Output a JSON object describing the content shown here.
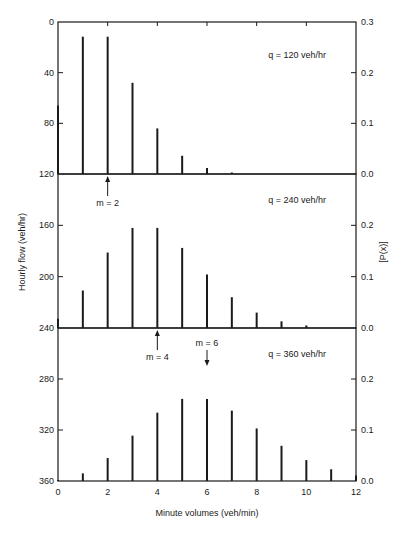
{
  "chart_data": {
    "type": "bar",
    "title": "",
    "xlabel": "Minute volumes (veh/min)",
    "ylabel_left": "Hourly flow (veh/hr)",
    "ylabel_right": "[P(x)]",
    "x_ticks": [
      0,
      2,
      4,
      6,
      8,
      10,
      12
    ],
    "xlim": [
      0,
      12
    ],
    "grid": false,
    "panels": [
      {
        "label": "q = 120 veh/hr",
        "mean_label": "m = 2",
        "mean": 2,
        "mean_arrow": "up-from-below",
        "left_ticks": [
          0,
          40,
          80,
          120
        ],
        "right_ticks": [
          0.3,
          0.2,
          0.1,
          0.0
        ],
        "ylim": [
          0,
          0.3
        ],
        "x": [
          0,
          1,
          2,
          3,
          4,
          5,
          6,
          7
        ],
        "values": [
          0.135,
          0.271,
          0.271,
          0.18,
          0.09,
          0.036,
          0.012,
          0.003
        ]
      },
      {
        "label": "q = 240 veh/hr",
        "mean_label": "m = 4",
        "mean": 4,
        "mean_arrow": "up-from-below",
        "left_ticks": [
          160,
          200,
          240
        ],
        "right_ticks": [
          0.2,
          0.1,
          0.0
        ],
        "ylim": [
          0,
          0.3
        ],
        "x": [
          0,
          1,
          2,
          3,
          4,
          5,
          6,
          7,
          8,
          9,
          10
        ],
        "values": [
          0.018,
          0.073,
          0.147,
          0.195,
          0.195,
          0.156,
          0.104,
          0.06,
          0.03,
          0.013,
          0.005
        ]
      },
      {
        "label": "q = 360 veh/hr",
        "mean_label": "m = 6",
        "mean": 6,
        "mean_arrow": "down-from-above",
        "left_ticks": [
          280,
          320,
          360
        ],
        "right_ticks": [
          0.2,
          0.1,
          0.0
        ],
        "ylim": [
          0,
          0.3
        ],
        "x": [
          0,
          1,
          2,
          3,
          4,
          5,
          6,
          7,
          8,
          9,
          10,
          11,
          12
        ],
        "values": [
          0.002,
          0.015,
          0.045,
          0.089,
          0.134,
          0.161,
          0.161,
          0.138,
          0.103,
          0.069,
          0.041,
          0.023,
          0.011
        ]
      }
    ]
  },
  "colors": {
    "ink": "#1a1a1a",
    "background": "#ffffff"
  }
}
